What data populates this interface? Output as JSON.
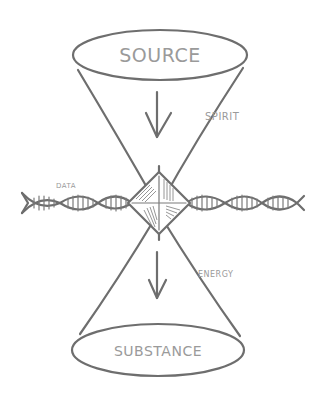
{
  "diagram": {
    "title": "",
    "nodes": [
      {
        "id": "source",
        "label": "SOURCE",
        "shape": "ellipse"
      },
      {
        "id": "substance",
        "label": "SUBSTANCE",
        "shape": "ellipse"
      },
      {
        "id": "nexus",
        "label": "",
        "shape": "hatched-diamond"
      }
    ],
    "flows": [
      {
        "from": "source",
        "to": "nexus",
        "label": "SPIRIT",
        "icon": "arrow-down-icon"
      },
      {
        "from": "nexus",
        "to": "substance",
        "label": "ENERGY",
        "icon": "arrow-down-icon"
      }
    ],
    "strand": {
      "label": "DATA",
      "icon": "dna-helix-icon"
    },
    "colors": {
      "stroke": "#6e6e6e",
      "text": "#9a9a9a",
      "background": "#ffffff"
    }
  }
}
